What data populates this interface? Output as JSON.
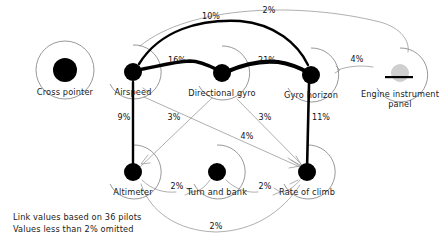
{
  "figure": {
    "caption": {
      "line1": "Link values based on 36 pilots",
      "line2": "Values less than 2% omitted"
    }
  },
  "nodes": [
    {
      "id": "cross-pointer",
      "label": "Cross pointer",
      "x": 65,
      "y": 70,
      "r": 27,
      "dot": 12,
      "style": "solid"
    },
    {
      "id": "airspeed",
      "label": "Airspeed",
      "x": 133,
      "y": 72,
      "r": 27,
      "dot": 9,
      "style": "solid"
    },
    {
      "id": "directional-gyro",
      "label": "Directional gyro",
      "x": 222,
      "y": 73,
      "r": 27,
      "dot": 9,
      "style": "solid"
    },
    {
      "id": "gyro-horizon",
      "label": "Gyro horizon",
      "x": 311,
      "y": 75,
      "r": 27,
      "dot": 9,
      "style": "solid"
    },
    {
      "id": "engine-panel",
      "label": "Engine instrument",
      "label2": "panel",
      "x": 400,
      "y": 75,
      "r": 27,
      "dot": 9,
      "style": "faint"
    },
    {
      "id": "altimeter",
      "label": "Altimeter",
      "x": 133,
      "y": 172,
      "r": 27,
      "dot": 9,
      "style": "solid"
    },
    {
      "id": "turn-and-bank",
      "label": "Turn and bank",
      "x": 217,
      "y": 172,
      "r": 27,
      "dot": 9,
      "style": "solid"
    },
    {
      "id": "rate-of-climb",
      "label": "Rate of climb",
      "x": 307,
      "y": 172,
      "r": 27,
      "dot": 9,
      "style": "solid"
    }
  ],
  "links": [
    {
      "id": "airspeed-directional-gyro",
      "from": "airspeed",
      "to": "directional-gyro",
      "value": "16%",
      "weight": "thick",
      "label_x": 177,
      "label_y": 63
    },
    {
      "id": "directional-gyro-gyro-horizon",
      "from": "directional-gyro",
      "to": "gyro-horizon",
      "value": "21%",
      "weight": "thick",
      "label_x": 267,
      "label_y": 63
    },
    {
      "id": "airspeed-gyro-horizon",
      "from": "airspeed",
      "to": "gyro-horizon",
      "value": "10%",
      "weight": "thick",
      "label_x": 211,
      "label_y": 19
    },
    {
      "id": "airspeed-engine-panel",
      "from": "airspeed",
      "to": "engine-panel",
      "value": "2%",
      "weight": "thin",
      "label_x": 269,
      "label_y": 13
    },
    {
      "id": "gyro-horizon-engine-panel",
      "from": "gyro-horizon",
      "to": "engine-panel",
      "value": "4%",
      "weight": "thin",
      "label_x": 357,
      "label_y": 62
    },
    {
      "id": "airspeed-altimeter",
      "from": "airspeed",
      "to": "altimeter",
      "value": "9%",
      "weight": "thick",
      "label_x": 124,
      "label_y": 120
    },
    {
      "id": "gyro-horizon-rate-of-climb",
      "from": "gyro-horizon",
      "to": "rate-of-climb",
      "value": "11%",
      "weight": "thick",
      "label_x": 321,
      "label_y": 120
    },
    {
      "id": "airspeed-rate-of-climb",
      "from": "airspeed",
      "to": "rate-of-climb",
      "value": "4%",
      "weight": "thin",
      "label_x": 247,
      "label_y": 139
    },
    {
      "id": "directional-gyro-altimeter",
      "from": "directional-gyro",
      "to": "altimeter",
      "value": "3%",
      "weight": "thin",
      "label_x": 174,
      "label_y": 120
    },
    {
      "id": "directional-gyro-rate-of-climb",
      "from": "directional-gyro",
      "to": "rate-of-climb",
      "value": "3%",
      "weight": "thin",
      "label_x": 265,
      "label_y": 120
    },
    {
      "id": "altimeter-turn-and-bank",
      "from": "altimeter",
      "to": "turn-and-bank",
      "value": "2%",
      "weight": "thin",
      "label_x": 177,
      "label_y": 189
    },
    {
      "id": "turn-and-bank-rate-of-climb",
      "from": "turn-and-bank",
      "to": "rate-of-climb",
      "value": "2%",
      "weight": "thin",
      "label_x": 265,
      "label_y": 189
    },
    {
      "id": "altimeter-rate-of-climb",
      "from": "altimeter",
      "to": "rate-of-climb",
      "value": "2%",
      "weight": "thin",
      "label_x": 216,
      "label_y": 229
    }
  ],
  "colors": {
    "thin_link": "#9a9a9a",
    "thick_link": "#000000",
    "ring": "#7d7d7d",
    "dot": "#000000",
    "dot_faint": "#cfcfcf",
    "text": "#1a1a1a",
    "background": "#ffffff"
  }
}
